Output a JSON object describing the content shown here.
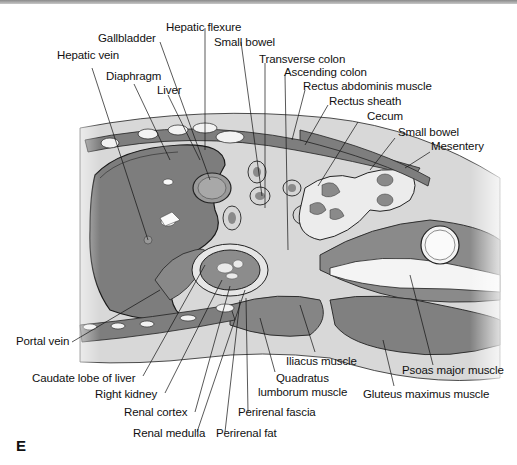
{
  "figure": {
    "panel_letter": "E",
    "colors": {
      "organ_dark": "#7a7a7a",
      "organ_mid": "#9a9a9a",
      "tissue_light": "#d4d4d4",
      "fat_white": "#f4f4f4",
      "outline": "#1a1a1a"
    },
    "labels": {
      "hepatic_flexure": "Hepatic flexure",
      "gallbladder": "Gallbladder",
      "small_bowel_top": "Small bowel",
      "hepatic_vein": "Hepatic vein",
      "transverse_colon": "Transverse colon",
      "ascending_colon": "Ascending colon",
      "diaphragm": "Diaphragm",
      "rectus_abdominis": "Rectus abdominis muscle",
      "liver": "Liver",
      "rectus_sheath": "Rectus sheath",
      "cecum": "Cecum",
      "small_bowel_right": "Small bowel",
      "mesentery": "Mesentery",
      "portal_vein": "Portal vein",
      "caudate_lobe": "Caudate lobe of liver",
      "right_kidney": "Right kidney",
      "renal_cortex": "Renal cortex",
      "renal_medulla": "Renal medulla",
      "perirenal_fat": "Perirenal fat",
      "perirenal_fascia": "Perirenal fascia",
      "quadratus_1": "Quadratus",
      "quadratus_2": "lumborum muscle",
      "iliacus": "Iliacus muscle",
      "psoas": "Psoas major muscle",
      "gluteus": "Gluteus maximus muscle"
    }
  }
}
